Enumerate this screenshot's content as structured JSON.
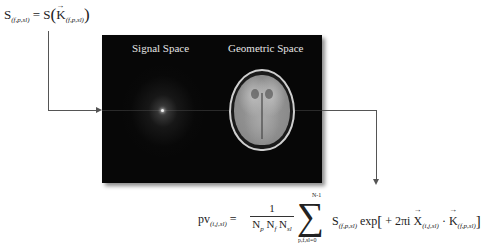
{
  "equations": {
    "top": {
      "lhs": "S",
      "lhs_sub": "(f,p,sl)",
      "equals": "=",
      "fn": "S",
      "open_paren": "(",
      "arg": "K",
      "arg_sub": "(f,p,sl)",
      "close_paren": ")"
    },
    "bottom": {
      "lhs": "pv",
      "lhs_sub": "(i,j,sl)",
      "equals": "=",
      "frac_num": "1",
      "frac_den_parts": [
        {
          "base": "N",
          "sub": "p"
        },
        {
          "base": "N",
          "sub": "f"
        },
        {
          "base": "N",
          "sub": "sl"
        }
      ],
      "sum_upper": "N-1",
      "sum_symbol": "∑",
      "sum_lower": "p,f,sl=0",
      "term_S": "S",
      "term_S_sub": "(f,p,sl)",
      "exp": "exp",
      "open_bracket": "[",
      "sign_coef": "+ 2πi",
      "X": "X",
      "X_sub": "(i,j,sl)",
      "dot": "·",
      "K": "K",
      "K_sub": "(f,p,sl)",
      "close_bracket": "]"
    }
  },
  "panel": {
    "left_title": "Signal Space",
    "right_title": "Geometric Space",
    "left_image": "k-space-signal-image",
    "right_image": "mri-axial-brain-image",
    "background": "#070707"
  },
  "connectors": {
    "color": "#555555"
  }
}
